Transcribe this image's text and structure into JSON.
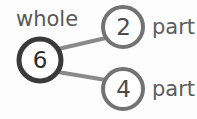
{
  "diagram": {
    "type": "number-bond",
    "background_color": "#fdfdfd",
    "whole": {
      "label": "whole",
      "value": "6",
      "circle_color": "#3a3a3a",
      "stroke_width": 5,
      "center_x": 40,
      "center_y": 60,
      "radius": 21
    },
    "parts": [
      {
        "label": "part",
        "value": "2",
        "circle_color": "#737373",
        "stroke_width": 4,
        "center_x": 123,
        "center_y": 27,
        "radius": 20
      },
      {
        "label": "part",
        "value": "4",
        "circle_color": "#737373",
        "stroke_width": 4,
        "center_x": 123,
        "center_y": 89,
        "radius": 20
      }
    ],
    "connectors": [
      {
        "name": "whole-to-part-top",
        "color": "#8a8a8a",
        "stroke_width": 4,
        "x1": 58,
        "y1": 49,
        "x2": 106,
        "y2": 38
      },
      {
        "name": "whole-to-part-bottom",
        "color": "#8a8a8a",
        "stroke_width": 4,
        "x1": 58,
        "y1": 72,
        "x2": 106,
        "y2": 80
      }
    ]
  }
}
